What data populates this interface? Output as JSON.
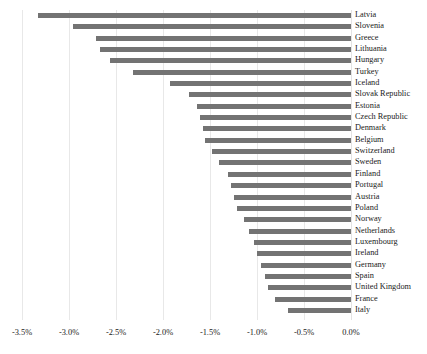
{
  "chart_data": {
    "type": "bar",
    "orientation": "horizontal",
    "title": "",
    "subtitle": "",
    "xlabel": "",
    "ylabel": "",
    "xlim": [
      -3.5,
      0.0
    ],
    "grid": true,
    "legend": false,
    "bar_color": "#737373",
    "gridline_color": "#e8e8e8",
    "tick_labels": [
      "-3.5%",
      "-3.0%",
      "-2.5%",
      "-2.0%",
      "-1.5%",
      "-1.0%",
      "-0.5%",
      "0.0%"
    ],
    "tick_values": [
      -3.5,
      -3.0,
      -2.5,
      -2.0,
      -1.5,
      -1.0,
      -0.5,
      0.0
    ],
    "categories": [
      "Latvia",
      "Slovenia",
      "Greece",
      "Lithuania",
      "Hungary",
      "Turkey",
      "Iceland",
      "Slovak Republic",
      "Estonia",
      "Czech Republic",
      "Denmark",
      "Belgium",
      "Switzerland",
      "Sweden",
      "Finland",
      "Portugal",
      "Austria",
      "Poland",
      "Norway",
      "Netherlands",
      "Luxembourg",
      "Ireland",
      "Germany",
      "Spain",
      "United Kingdom",
      "France",
      "Italy"
    ],
    "values": [
      -3.33,
      -2.96,
      -2.71,
      -2.67,
      -2.56,
      -2.32,
      -1.93,
      -1.72,
      -1.64,
      -1.61,
      -1.57,
      -1.55,
      -1.48,
      -1.4,
      -1.31,
      -1.28,
      -1.24,
      -1.21,
      -1.14,
      -1.09,
      -1.03,
      -1.0,
      -0.96,
      -0.91,
      -0.88,
      -0.81,
      -0.67
    ]
  }
}
